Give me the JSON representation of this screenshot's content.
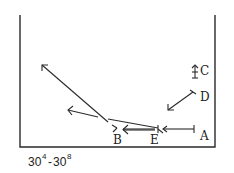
{
  "diagram": {
    "labels": {
      "A": "A",
      "B": "B",
      "C": "C",
      "D": "D",
      "E": "E"
    },
    "caption": {
      "base1": "30",
      "sup1": "4",
      "dash": "-",
      "base2": "30",
      "sup2": "8"
    },
    "color": "#2a2a2a"
  }
}
